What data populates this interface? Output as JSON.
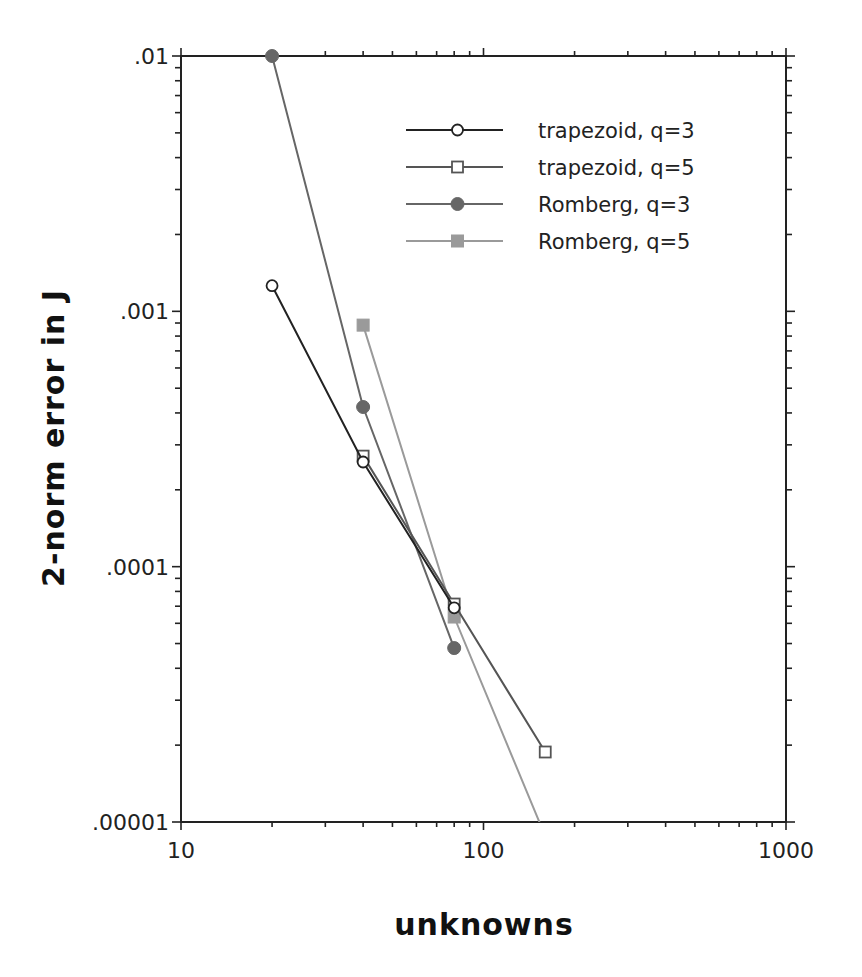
{
  "chart_data": {
    "type": "line",
    "title": "",
    "xlabel": "unknowns",
    "ylabel": "2-norm error in J",
    "xscale": "log",
    "yscale": "log",
    "xlim": [
      10,
      1000
    ],
    "ylim": [
      1e-05,
      0.01
    ],
    "grid": false,
    "legend_position": "upper right (inside)",
    "x_tick_labels": [
      "10",
      "100",
      "1000"
    ],
    "y_tick_labels": [
      ".00001",
      ".0001",
      ".001",
      ".01"
    ],
    "series": [
      {
        "name": "trapezoid, q=3",
        "marker": "open-circle",
        "color": "#222222",
        "x": [
          20,
          40,
          80
        ],
        "values": [
          0.00126,
          0.000257,
          6.9e-05
        ]
      },
      {
        "name": "trapezoid, q=5",
        "marker": "open-square",
        "color": "#555555",
        "x": [
          40,
          80,
          160
        ],
        "values": [
          0.000271,
          7.14e-05,
          1.88e-05
        ]
      },
      {
        "name": "Romberg, q=3",
        "marker": "filled-circle",
        "color": "#666666",
        "x": [
          20,
          40,
          80
        ],
        "values": [
          0.01,
          0.000422,
          4.8e-05
        ]
      },
      {
        "name": "Romberg, q=5",
        "marker": "filled-square",
        "color": "#9a9a9a",
        "x": [
          40,
          80,
          160
        ],
        "values": [
          0.000883,
          6.35e-05,
          8.8e-06
        ]
      }
    ]
  }
}
